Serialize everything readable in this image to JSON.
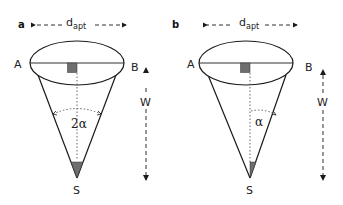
{
  "panels": [
    {
      "id": "a",
      "label": "a",
      "aperture_label": "d",
      "aperture_sub": "apt",
      "point_left": "A",
      "point_right": "B",
      "apex": "S",
      "height_label": "W",
      "angle_label": "2α"
    },
    {
      "id": "b",
      "label": "b",
      "aperture_label": "d",
      "aperture_sub": "apt",
      "point_left": "A",
      "point_right": "B",
      "apex": "S",
      "height_label": "W",
      "angle_label": "α"
    }
  ],
  "colors": {
    "stroke": "#1a1a1a",
    "fill_gray": "#6e6e6e",
    "dotted": "#555555"
  }
}
